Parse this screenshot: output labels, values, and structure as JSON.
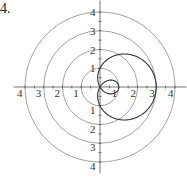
{
  "problem_number": "4.",
  "chart_data": {
    "type": "line",
    "subtype": "polar",
    "title": "",
    "equation_inferred": "r = 1 + 2cos(theta)",
    "center_px": [
      100,
      87
    ],
    "px_per_unit": 18.75,
    "grid_circles": [
      1,
      2,
      3,
      4
    ],
    "axis_tick_labels": {
      "right": [
        "1",
        "2",
        "3",
        "4"
      ],
      "left": [
        "1",
        "2",
        "3",
        "4"
      ],
      "up": [
        "1",
        "2",
        "3",
        "4"
      ],
      "down": [
        "1",
        "2",
        "3",
        "4"
      ]
    },
    "curve": {
      "description": "limacon with inner loop",
      "max_r": 3,
      "inner_loop_extent": 1,
      "y_intercepts": [
        1,
        -1
      ]
    },
    "grid": true,
    "legend": null
  }
}
